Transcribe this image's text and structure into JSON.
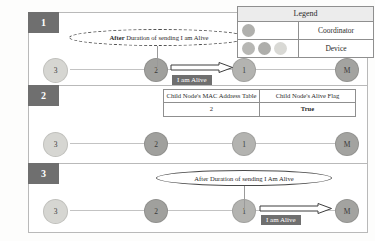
{
  "legend": {
    "title": "Legend",
    "rows": [
      {
        "label": "Coordinator",
        "swatch_count": 1
      },
      {
        "label": "Device",
        "swatch_count": 3
      }
    ]
  },
  "flag_table": {
    "headers": [
      "Child Node's MAC Address Table",
      "Child Node's Alive Flag"
    ],
    "row": [
      "2",
      "True"
    ]
  },
  "panels": [
    {
      "badge": "1",
      "bubble": "After Duration of sending I am Alive",
      "bubble_bold_prefix": "After",
      "message_chip": "I am Alive",
      "nodes": [
        {
          "label": "3",
          "kind": "device"
        },
        {
          "label": "2",
          "kind": "device"
        },
        {
          "label": "1",
          "kind": "device"
        },
        {
          "label": "M",
          "kind": "coordinator"
        }
      ]
    },
    {
      "badge": "2",
      "nodes": [
        {
          "label": "3",
          "kind": "device"
        },
        {
          "label": "2",
          "kind": "device"
        },
        {
          "label": "1",
          "kind": "device"
        },
        {
          "label": "M",
          "kind": "coordinator"
        }
      ]
    },
    {
      "badge": "3",
      "bubble": "After Duration of sending I Am Alive",
      "message_chip": "I am Alive",
      "nodes": [
        {
          "label": "3",
          "kind": "device"
        },
        {
          "label": "2",
          "kind": "device"
        },
        {
          "label": "1",
          "kind": "device"
        },
        {
          "label": "M",
          "kind": "coordinator"
        }
      ]
    }
  ],
  "colors": {
    "badge_bg": "#6f6f6f",
    "chip_bg": "#6f6f6f",
    "node_light": "#d6d6d2",
    "node_mid": "#b3b3b0",
    "node_dark": "#a0a09d",
    "border": "#8f8f8f",
    "link": "#c3c3c3"
  }
}
